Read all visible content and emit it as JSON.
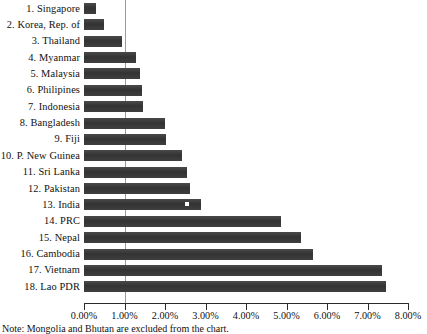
{
  "chart_data": {
    "type": "bar",
    "orientation": "horizontal",
    "title": "",
    "xlabel": "",
    "ylabel": "",
    "xlim": [
      0,
      8
    ],
    "xticks": [
      "0.00%",
      "1.00%",
      "2.00%",
      "3.00%",
      "4.00%",
      "5.00%",
      "6.00%",
      "7.00%",
      "8.00%"
    ],
    "xtick_values": [
      0,
      1,
      2,
      3,
      4,
      5,
      6,
      7,
      8
    ],
    "grid": "single vertical gridline at 1.00%",
    "gridline_value": 1.0,
    "legend": "none",
    "bar_color": "#3a3a3a",
    "categories": [
      "1. Singapore",
      "2. Korea, Rep. of",
      "3. Thailand",
      "4. Myanmar",
      "5. Malaysia",
      "6. Philipines",
      "7. Indonesia",
      "8. Bangladesh",
      "9. Fiji",
      "10. P. New Guinea",
      "11. Sri Lanka",
      "12. Pakistan",
      "13. India",
      "14. PRC",
      "15. Nepal",
      "16. Cambodia",
      "17. Vietnam",
      "18. Lao PDR"
    ],
    "values": [
      0.3,
      0.49,
      0.94,
      1.28,
      1.38,
      1.43,
      1.46,
      2.0,
      2.02,
      2.42,
      2.54,
      2.62,
      2.89,
      4.87,
      5.36,
      5.66,
      7.36,
      7.46
    ]
  },
  "note": {
    "text": "Note: Mongolia and Bhutan are excluded from the chart."
  }
}
